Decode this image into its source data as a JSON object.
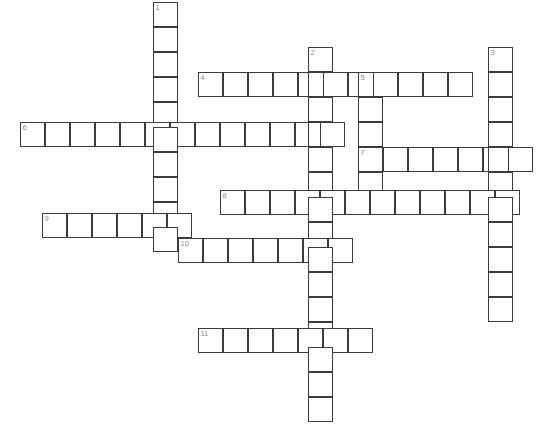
{
  "page": {
    "header_text": "",
    "width": 551,
    "height": 428,
    "background_color": "#ffffff"
  },
  "grid": {
    "cell_size": 25,
    "cell_border_color": "#3b3b3b",
    "cell_border_width": 1.6,
    "cell_fill_color": "#ffffff",
    "number_color": "#8a8d93",
    "number_font_size": 7.5,
    "origin_x": 20,
    "origin_y": 2,
    "columns": 21,
    "rows": 17
  },
  "entries": [
    {
      "number": "1",
      "direction": "down",
      "start_x": 153,
      "start_y": 2,
      "length": 10
    },
    {
      "number": "2",
      "direction": "down",
      "start_x": 308,
      "start_y": 47,
      "length": 15
    },
    {
      "number": "3",
      "direction": "down",
      "start_x": 488,
      "start_y": 47,
      "length": 11
    },
    {
      "number": "4",
      "direction": "across",
      "start_x": 198,
      "start_y": 72,
      "length": 11
    },
    {
      "number": "5",
      "direction": "down",
      "start_x": 358,
      "start_y": 72,
      "length": 5
    },
    {
      "number": "6",
      "direction": "across",
      "start_x": 20,
      "start_y": 122,
      "length": 13
    },
    {
      "number": "7",
      "direction": "across",
      "start_x": 358,
      "start_y": 147,
      "length": 7
    },
    {
      "number": "8",
      "direction": "across",
      "start_x": 220,
      "start_y": 190,
      "length": 12
    },
    {
      "number": "9",
      "direction": "across",
      "start_x": 42,
      "start_y": 213,
      "length": 6
    },
    {
      "number": "10",
      "direction": "across",
      "start_x": 178,
      "start_y": 238,
      "length": 7
    },
    {
      "number": "11",
      "direction": "across",
      "start_x": 198,
      "start_y": 328,
      "length": 7
    }
  ],
  "cells": [
    {
      "x": 153,
      "y": 2,
      "number": "1"
    },
    {
      "x": 153,
      "y": 27,
      "number": ""
    },
    {
      "x": 153,
      "y": 52,
      "number": ""
    },
    {
      "x": 153,
      "y": 77,
      "number": ""
    },
    {
      "x": 153,
      "y": 102,
      "number": ""
    },
    {
      "x": 153,
      "y": 127,
      "number": ""
    },
    {
      "x": 153,
      "y": 152,
      "number": ""
    },
    {
      "x": 153,
      "y": 177,
      "number": ""
    },
    {
      "x": 153,
      "y": 202,
      "number": ""
    },
    {
      "x": 308,
      "y": 47,
      "number": "2"
    },
    {
      "x": 308,
      "y": 97,
      "number": ""
    },
    {
      "x": 308,
      "y": 122,
      "number": ""
    },
    {
      "x": 308,
      "y": 147,
      "number": ""
    },
    {
      "x": 308,
      "y": 172,
      "number": ""
    },
    {
      "x": 308,
      "y": 215,
      "number": ""
    },
    {
      "x": 308,
      "y": 263,
      "number": ""
    },
    {
      "x": 308,
      "y": 288,
      "number": ""
    },
    {
      "x": 308,
      "y": 303,
      "number": ""
    },
    {
      "x": 308,
      "y": 353,
      "number": ""
    },
    {
      "x": 308,
      "y": 378,
      "number": ""
    },
    {
      "x": 308,
      "y": 398,
      "number": ""
    },
    {
      "x": 488,
      "y": 47,
      "number": "3"
    },
    {
      "x": 488,
      "y": 72,
      "number": ""
    },
    {
      "x": 488,
      "y": 97,
      "number": ""
    },
    {
      "x": 488,
      "y": 122,
      "number": ""
    },
    {
      "x": 488,
      "y": 172,
      "number": ""
    },
    {
      "x": 488,
      "y": 197,
      "number": ""
    },
    {
      "x": 488,
      "y": 222,
      "number": ""
    },
    {
      "x": 488,
      "y": 247,
      "number": ""
    },
    {
      "x": 488,
      "y": 272,
      "number": ""
    },
    {
      "x": 488,
      "y": 297,
      "number": ""
    },
    {
      "x": 198,
      "y": 72,
      "number": "4"
    },
    {
      "x": 223,
      "y": 72,
      "number": ""
    },
    {
      "x": 248,
      "y": 72,
      "number": ""
    },
    {
      "x": 273,
      "y": 72,
      "number": ""
    },
    {
      "x": 298,
      "y": 72,
      "number": ""
    },
    {
      "x": 333,
      "y": 72,
      "number": ""
    },
    {
      "x": 358,
      "y": 72,
      "number": "5"
    },
    {
      "x": 383,
      "y": 72,
      "number": ""
    },
    {
      "x": 408,
      "y": 72,
      "number": ""
    },
    {
      "x": 433,
      "y": 72,
      "number": ""
    },
    {
      "x": 358,
      "y": 97,
      "number": ""
    },
    {
      "x": 358,
      "y": 122,
      "number": ""
    },
    {
      "x": 358,
      "y": 172,
      "number": ""
    },
    {
      "x": 20,
      "y": 122,
      "number": "6"
    },
    {
      "x": 45,
      "y": 122,
      "number": ""
    },
    {
      "x": 70,
      "y": 122,
      "number": ""
    },
    {
      "x": 95,
      "y": 122,
      "number": ""
    },
    {
      "x": 120,
      "y": 122,
      "number": ""
    },
    {
      "x": 178,
      "y": 122,
      "number": ""
    },
    {
      "x": 203,
      "y": 122,
      "number": ""
    },
    {
      "x": 228,
      "y": 122,
      "number": ""
    },
    {
      "x": 253,
      "y": 122,
      "number": ""
    },
    {
      "x": 278,
      "y": 122,
      "number": ""
    },
    {
      "x": 358,
      "y": 147,
      "number": "7"
    },
    {
      "x": 383,
      "y": 147,
      "number": ""
    },
    {
      "x": 408,
      "y": 147,
      "number": ""
    },
    {
      "x": 433,
      "y": 147,
      "number": ""
    },
    {
      "x": 458,
      "y": 147,
      "number": ""
    },
    {
      "x": 513,
      "y": 147,
      "number": ""
    },
    {
      "x": 220,
      "y": 190,
      "number": "8"
    },
    {
      "x": 245,
      "y": 190,
      "number": ""
    },
    {
      "x": 270,
      "y": 190,
      "number": ""
    },
    {
      "x": 295,
      "y": 190,
      "number": ""
    },
    {
      "x": 333,
      "y": 190,
      "number": ""
    },
    {
      "x": 358,
      "y": 190,
      "number": ""
    },
    {
      "x": 383,
      "y": 190,
      "number": ""
    },
    {
      "x": 408,
      "y": 190,
      "number": ""
    },
    {
      "x": 433,
      "y": 190,
      "number": ""
    },
    {
      "x": 458,
      "y": 190,
      "number": ""
    },
    {
      "x": 42,
      "y": 213,
      "number": "9"
    },
    {
      "x": 67,
      "y": 213,
      "number": ""
    },
    {
      "x": 92,
      "y": 213,
      "number": ""
    },
    {
      "x": 117,
      "y": 213,
      "number": ""
    },
    {
      "x": 142,
      "y": 213,
      "number": ""
    },
    {
      "x": 178,
      "y": 238,
      "number": "10"
    },
    {
      "x": 203,
      "y": 238,
      "number": ""
    },
    {
      "x": 228,
      "y": 238,
      "number": ""
    },
    {
      "x": 253,
      "y": 238,
      "number": ""
    },
    {
      "x": 278,
      "y": 238,
      "number": ""
    },
    {
      "x": 333,
      "y": 238,
      "number": ""
    },
    {
      "x": 198,
      "y": 328,
      "number": "11"
    },
    {
      "x": 223,
      "y": 328,
      "number": ""
    },
    {
      "x": 248,
      "y": 328,
      "number": ""
    },
    {
      "x": 273,
      "y": 328,
      "number": ""
    },
    {
      "x": 283,
      "y": 328,
      "number": ""
    },
    {
      "x": 333,
      "y": 328,
      "number": ""
    },
    {
      "x": 348,
      "y": 328,
      "number": ""
    }
  ]
}
